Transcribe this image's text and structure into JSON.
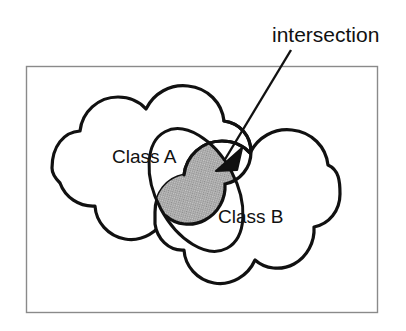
{
  "diagram": {
    "type": "venn-cloud-diagram",
    "background_color": "#ffffff",
    "frame": {
      "name": "outer-frame",
      "stroke_color": "#8a8a8a",
      "fill_color": "#ffffff",
      "x": 26,
      "y": 66,
      "width": 352,
      "height": 247
    },
    "callout": {
      "label": "intersection",
      "text_x": 272,
      "text_y": 42,
      "leader_from": [
        291,
        50
      ],
      "leader_to": [
        222,
        163
      ],
      "stroke_color": "#111111",
      "arrow_fill": "#111111",
      "arrow_tip": [
        216,
        171
      ]
    },
    "regions": [
      {
        "name": "class-a-cloud",
        "label": "Class A",
        "label_x": 112,
        "label_y": 163,
        "stroke_color": "#111111",
        "fill_color": "#ffffff",
        "center": [
          150,
          168
        ],
        "bounds": [
          52,
          90,
          250,
          245
        ]
      },
      {
        "name": "class-b-cloud",
        "label": "Class B",
        "label_x": 218,
        "label_y": 223,
        "stroke_color": "#111111",
        "fill_color": "#ffffff",
        "center": [
          249,
          212
        ],
        "bounds": [
          155,
          135,
          340,
          288
        ]
      }
    ],
    "intersection": {
      "name": "intersection-region",
      "fill_color": "#b9b9b9",
      "stroke_color": "#111111",
      "shape": "tilted-lens",
      "center": [
        196,
        190
      ],
      "rotation_deg": -28,
      "radius_x": 38,
      "radius_y": 62
    }
  }
}
